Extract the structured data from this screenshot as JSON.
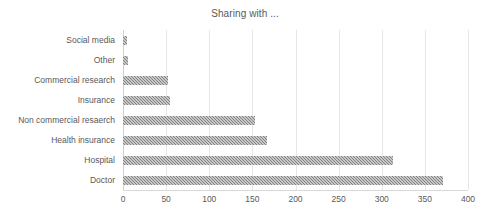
{
  "chart_data": {
    "type": "bar",
    "orientation": "horizontal",
    "title": "Sharing with ...",
    "xlabel": "",
    "ylabel": "",
    "categories": [
      "Social media",
      "Other",
      "Commercial research",
      "Insurance",
      "Non commercial resaerch",
      "Health insurance",
      "Hospital",
      "Doctor"
    ],
    "values": [
      5,
      6,
      52,
      54,
      153,
      167,
      313,
      371
    ],
    "xlim": [
      0,
      400
    ],
    "xticks": [
      0,
      50,
      100,
      150,
      200,
      250,
      300,
      350,
      400
    ],
    "xtick_labels": [
      "0",
      "50",
      "100",
      "150",
      "200",
      "250",
      "300",
      "350",
      "400"
    ],
    "grid": "vertical",
    "legend": "none",
    "bar_color": "#838383",
    "bar_fill_pattern": "checkered-dots",
    "gridline_color": "#e6e6e6",
    "text_color": "#595959",
    "background_color": "#ffffff"
  }
}
